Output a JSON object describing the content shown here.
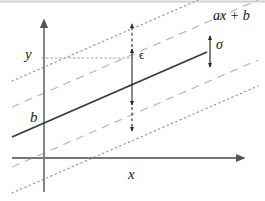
{
  "figure": {
    "background_color": "#ffffff",
    "frame_color": "#cfcfcf",
    "axes": {
      "x_label": "x",
      "y_label": "y",
      "axis_color": "#6b6b6b",
      "x_axis": {
        "y": 158,
        "x_start": 12,
        "x_end": 248
      },
      "y_axis": {
        "x": 44,
        "y_start": 16,
        "y_end": 192
      }
    },
    "regression_line": {
      "label": "ax + b",
      "intercept_label": "b",
      "color": "#3c3c3c",
      "style": "solid",
      "x_start": 12,
      "y_start": 137,
      "x_end": 207,
      "y_end": 52
    },
    "inner_band": {
      "style": "dashed",
      "color": "#b4b4b4",
      "offset": 30
    },
    "outer_band": {
      "style": "dotted",
      "color": "#9a9a9a",
      "offset": 56
    },
    "sigma_marker": {
      "label": "σ",
      "color": "#2b2b2b",
      "x": 210,
      "y_top": 34,
      "y_bottom": 69
    },
    "epsilon_marker": {
      "label": "ϵ",
      "color": "#2b2b2b",
      "x": 132,
      "y_outer_top": 21,
      "y_inner_top": 47,
      "y_inner_bottom": 107,
      "y_outer_bottom": 133
    },
    "guide_line": {
      "style": "dotted",
      "color": "#9a9a9a",
      "from_x": 44,
      "to_x": 132,
      "y": 58
    }
  }
}
